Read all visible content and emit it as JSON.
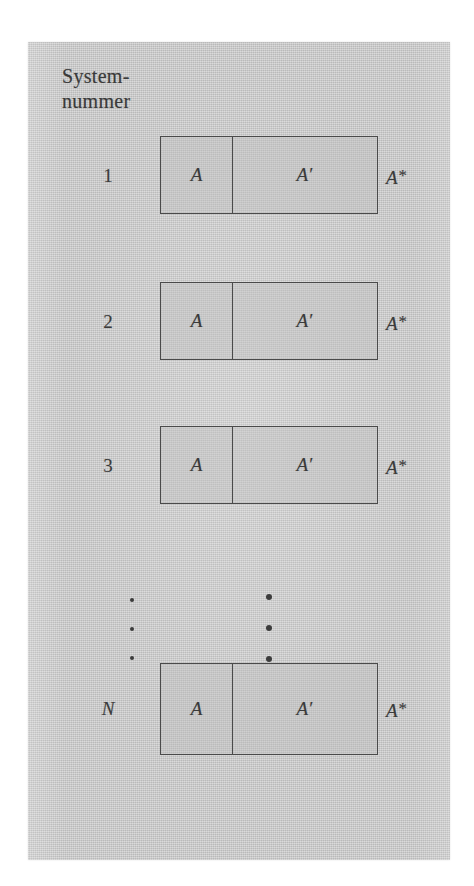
{
  "figure": {
    "caption_lines": [
      "System-",
      "nummer"
    ],
    "language": "de",
    "panel_color": "#c9c9c9",
    "ink_color": "#3a3a3a",
    "border_color": "#4a4a4a",
    "rows": [
      {
        "number": "1",
        "number_italic": false,
        "left_cell": "A",
        "right_cell": "A",
        "right_cell_prime": "′",
        "outside_label": "A",
        "outside_label_star": "*"
      },
      {
        "number": "2",
        "number_italic": false,
        "left_cell": "A",
        "right_cell": "A",
        "right_cell_prime": "′",
        "outside_label": "A",
        "outside_label_star": "*"
      },
      {
        "number": "3",
        "number_italic": false,
        "left_cell": "A",
        "right_cell": "A",
        "right_cell_prime": "′",
        "outside_label": "A",
        "outside_label_star": "*"
      },
      {
        "number": "N",
        "number_italic": true,
        "left_cell": "A",
        "right_cell": "A",
        "right_cell_prime": "′",
        "outside_label": "A",
        "outside_label_star": "*"
      }
    ],
    "ellipsis": {
      "left_column_dots": 3,
      "right_column_dots": 3
    }
  }
}
